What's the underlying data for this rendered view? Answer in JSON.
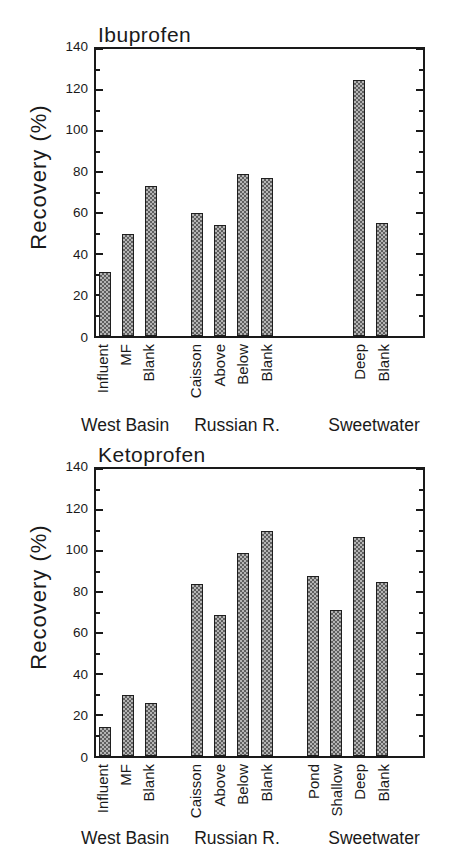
{
  "figure": {
    "background": "#ffffff",
    "text_color": "#1a1a1a",
    "bar_fill_dark": "#5e5e5e",
    "bar_fill_light": "#b4b4b4",
    "bar_border": "#1f1f1f"
  },
  "chart_data": [
    {
      "type": "bar",
      "title": "Ibuprofen",
      "xlabel": "",
      "ylabel": "Recovery (%)",
      "ylim": [
        0,
        140
      ],
      "y_major_ticks": [
        0,
        20,
        40,
        60,
        80,
        100,
        120,
        140
      ],
      "y_tick_labels": [
        "0",
        "20",
        "40",
        "60",
        "80",
        "100",
        "120",
        "140"
      ],
      "y_minor_step": 10,
      "grid": false,
      "legend": false,
      "bar_pattern": "gray checkerboard crosshatch with black outline",
      "groups": [
        {
          "label": "West Basin",
          "bars": [
            {
              "label": "Influent",
              "value": 31,
              "slot": 0
            },
            {
              "label": "MF",
              "value": 50,
              "slot": 1
            },
            {
              "label": "Blank",
              "value": 73,
              "slot": 2
            }
          ]
        },
        {
          "label": "Russian R.",
          "bars": [
            {
              "label": "Caisson",
              "value": 60,
              "slot": 4
            },
            {
              "label": "Above",
              "value": 54,
              "slot": 5
            },
            {
              "label": "Below",
              "value": 79,
              "slot": 6
            },
            {
              "label": "Blank",
              "value": 77,
              "slot": 7
            }
          ]
        },
        {
          "label": "Sweetwater",
          "bars": [
            {
              "label": "Deep",
              "value": 125,
              "slot": 11
            },
            {
              "label": "Blank",
              "value": 55,
              "slot": 12
            }
          ]
        }
      ]
    },
    {
      "type": "bar",
      "title": "Ketoprofen",
      "xlabel": "",
      "ylabel": "Recovery (%)",
      "ylim": [
        0,
        140
      ],
      "y_major_ticks": [
        0,
        20,
        40,
        60,
        80,
        100,
        120,
        140
      ],
      "y_tick_labels": [
        "0",
        "20",
        "40",
        "60",
        "80",
        "100",
        "120",
        "140"
      ],
      "y_minor_step": 10,
      "grid": false,
      "legend": false,
      "bar_pattern": "gray checkerboard crosshatch with black outline",
      "groups": [
        {
          "label": "West Basin",
          "bars": [
            {
              "label": "Influent",
              "value": 14,
              "slot": 0
            },
            {
              "label": "MF",
              "value": 30,
              "slot": 1
            },
            {
              "label": "Blank",
              "value": 26,
              "slot": 2
            }
          ]
        },
        {
          "label": "Russian R.",
          "bars": [
            {
              "label": "Caisson",
              "value": 84,
              "slot": 4
            },
            {
              "label": "Above",
              "value": 69,
              "slot": 5
            },
            {
              "label": "Below",
              "value": 99,
              "slot": 6
            },
            {
              "label": "Blank",
              "value": 110,
              "slot": 7
            }
          ]
        },
        {
          "label": "Sweetwater",
          "bars": [
            {
              "label": "Pond",
              "value": 88,
              "slot": 9
            },
            {
              "label": "Shallow",
              "value": 71,
              "slot": 10
            },
            {
              "label": "Deep",
              "value": 107,
              "slot": 11
            },
            {
              "label": "Blank",
              "value": 85,
              "slot": 12
            }
          ]
        }
      ]
    }
  ]
}
